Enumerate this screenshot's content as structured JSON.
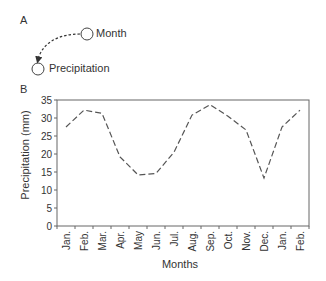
{
  "panels": {
    "a": {
      "label": "A",
      "nodes": [
        {
          "id": "month",
          "label": "Month"
        },
        {
          "id": "precipitation",
          "label": "Precipitation"
        }
      ],
      "edge": {
        "from": "month",
        "to": "precipitation",
        "style": "dashed",
        "arrow": true
      }
    },
    "b": {
      "label": "B"
    }
  },
  "chart_data": {
    "type": "line",
    "title": "",
    "xlabel": "Months",
    "ylabel": "Precipitation (mm)",
    "categories": [
      "Jan.",
      "Feb.",
      "Mar.",
      "Apr.",
      "May",
      "Jun.",
      "Jul.",
      "Aug.",
      "Sep.",
      "Oct.",
      "Nov.",
      "Dec.",
      "Jan.",
      "Feb."
    ],
    "series": [
      {
        "name": "Precipitation",
        "line_style": "dashed",
        "color": "#555555",
        "values": [
          27.5,
          32.2,
          31.3,
          19.2,
          14.2,
          14.6,
          20.5,
          30.8,
          33.7,
          30.5,
          26.7,
          13.3,
          27.5,
          32.2
        ]
      }
    ],
    "ylim": [
      0,
      35
    ],
    "yticks": [
      0,
      5,
      10,
      15,
      20,
      25,
      30,
      35
    ],
    "grid": false,
    "legend": "none"
  }
}
